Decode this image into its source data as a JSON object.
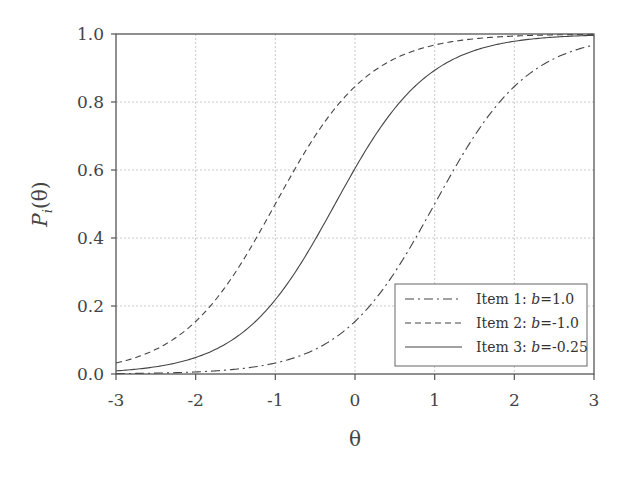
{
  "chart_data": {
    "type": "line",
    "title": "",
    "xlabel": "θ",
    "ylabel": "P_i(θ)",
    "xlim": [
      -3,
      3
    ],
    "ylim": [
      0,
      1
    ],
    "xticks": [
      "-3",
      "-2",
      "-1",
      "0",
      "1",
      "2",
      "3"
    ],
    "yticks": [
      "0.0",
      "0.2",
      "0.4",
      "0.6",
      "0.8",
      "1.0"
    ],
    "grid": true,
    "legend_position": "lower right",
    "model": "logistic P = 1/(1+exp(-1.7(θ-b)))",
    "x": [
      -3,
      -2.5,
      -2,
      -1.5,
      -1,
      -0.5,
      0,
      0.5,
      1,
      1.5,
      2,
      2.5,
      3
    ],
    "series": [
      {
        "name": "Item 1: b=1.0",
        "b": 1.0,
        "style": "dash-dot",
        "values": [
          0.001,
          0.002,
          0.006,
          0.014,
          0.032,
          0.072,
          0.154,
          0.3,
          0.5,
          0.7,
          0.846,
          0.928,
          0.968
        ]
      },
      {
        "name": "Item 2: b=-1.0",
        "b": -1.0,
        "style": "dashed",
        "values": [
          0.032,
          0.072,
          0.154,
          0.3,
          0.5,
          0.7,
          0.846,
          0.928,
          0.968,
          0.986,
          0.994,
          0.997,
          0.999
        ]
      },
      {
        "name": "Item 3: b=-0.25",
        "b": -0.25,
        "style": "solid",
        "values": [
          0.009,
          0.021,
          0.047,
          0.103,
          0.219,
          0.395,
          0.605,
          0.781,
          0.897,
          0.953,
          0.979,
          0.991,
          0.996
        ]
      }
    ]
  },
  "legend": [
    {
      "prefix": "Item 1: ",
      "var": "b",
      "suffix": "=1.0"
    },
    {
      "prefix": "Item 2: ",
      "var": "b",
      "suffix": "=-1.0"
    },
    {
      "prefix": "Item 3: ",
      "var": "b",
      "suffix": "=-0.25"
    }
  ],
  "axis": {
    "xlabel": "θ",
    "ylabel_main": "P",
    "ylabel_sub": "i",
    "ylabel_arg": "(θ)"
  }
}
